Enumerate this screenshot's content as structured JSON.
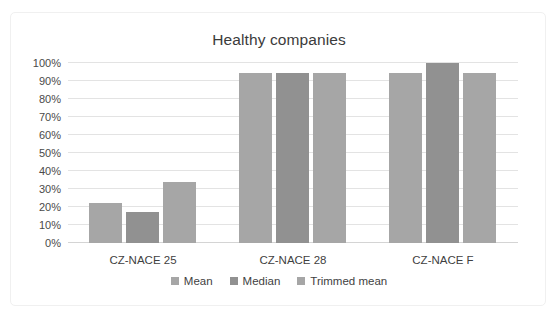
{
  "chart_data": {
    "type": "bar",
    "title": "Healthy companies",
    "xlabel": "",
    "ylabel": "",
    "categories": [
      "CZ-NACE 25",
      "CZ-NACE 28",
      "CZ-NACE F"
    ],
    "series": [
      {
        "name": "Mean",
        "color": "#a6a6a6",
        "values": [
          22,
          94.5,
          94.5
        ]
      },
      {
        "name": "Median",
        "color": "#919191",
        "values": [
          17,
          94.5,
          100
        ]
      },
      {
        "name": "Trimmed mean",
        "color": "#a6a6a6",
        "values": [
          34,
          94.5,
          94.5
        ]
      }
    ],
    "ylim": [
      0,
      100
    ],
    "ytick_labels": [
      "100%",
      "90%",
      "80%",
      "70%",
      "60%",
      "50%",
      "40%",
      "30%",
      "20%",
      "10%",
      "0%"
    ],
    "ytick_values": [
      100,
      90,
      80,
      70,
      60,
      50,
      40,
      30,
      20,
      10,
      0
    ],
    "grid": true,
    "legend_position": "bottom",
    "value_suffix": "%"
  },
  "colors": {
    "gridline": "#e3e3e3",
    "axis": "#d4d4d4",
    "text": "#3f3f3f",
    "title": "#3b3b3b",
    "frame": "#f0f0f0",
    "background": "#ffffff"
  }
}
